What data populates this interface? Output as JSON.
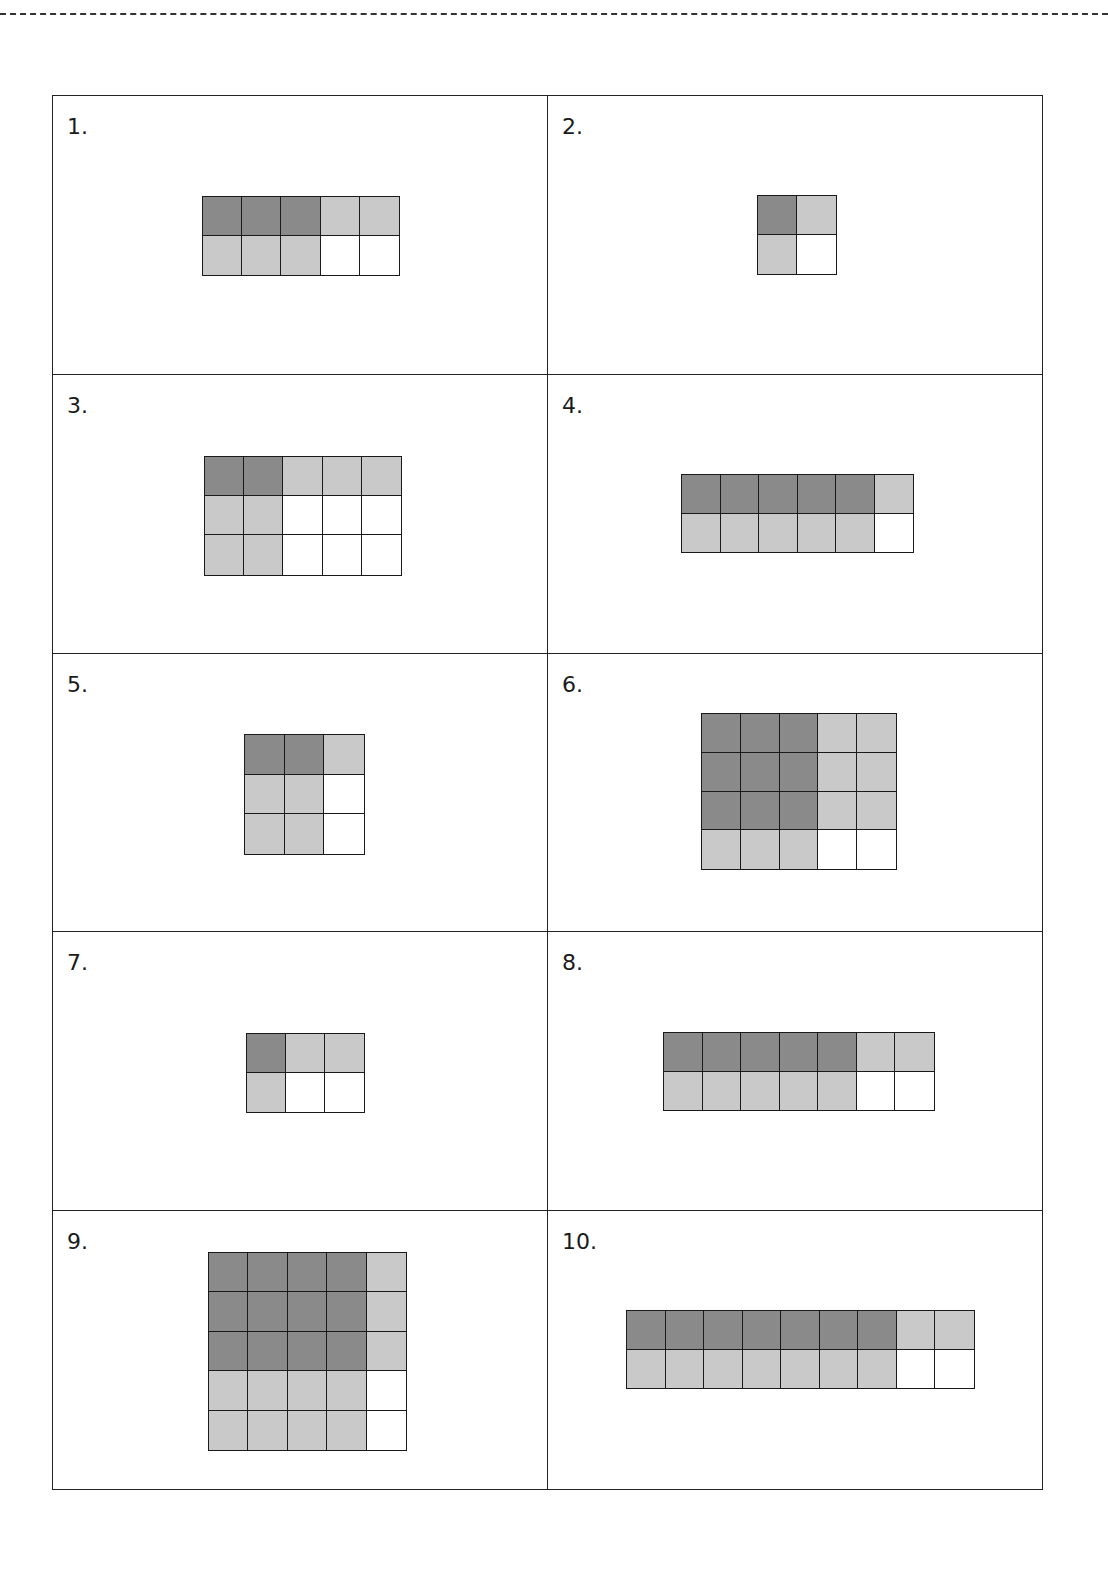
{
  "colors": {
    "dark": "#8a8a8a",
    "light": "#c9c9c9",
    "empty": "#ffffff",
    "line": "#1a1a1a"
  },
  "problems": [
    {
      "label": "1.",
      "rows": 2,
      "cols": 5,
      "pattern": [
        "DDDLL",
        "LLLWW"
      ],
      "dark_count": 3,
      "light_count": 5,
      "empty_count": 2
    },
    {
      "label": "2.",
      "rows": 2,
      "cols": 2,
      "pattern": [
        "DL",
        "LW"
      ],
      "dark_count": 1,
      "light_count": 2,
      "empty_count": 1
    },
    {
      "label": "3.",
      "rows": 3,
      "cols": 5,
      "pattern": [
        "DDLLL",
        "LLWWW",
        "LLWWW"
      ],
      "dark_count": 2,
      "light_count": 7,
      "empty_count": 6
    },
    {
      "label": "4.",
      "rows": 2,
      "cols": 6,
      "pattern": [
        "DDDDDL",
        "LLLLLW"
      ],
      "dark_count": 5,
      "light_count": 6,
      "empty_count": 1
    },
    {
      "label": "5.",
      "rows": 3,
      "cols": 3,
      "pattern": [
        "DDL",
        "LLW",
        "LLW"
      ],
      "dark_count": 2,
      "light_count": 5,
      "empty_count": 2
    },
    {
      "label": "6.",
      "rows": 4,
      "cols": 5,
      "pattern": [
        "DDDLL",
        "DDDLL",
        "DDDLL",
        "LLLWW"
      ],
      "dark_count": 9,
      "light_count": 9,
      "empty_count": 2
    },
    {
      "label": "7.",
      "rows": 2,
      "cols": 3,
      "pattern": [
        "DLL",
        "LWW"
      ],
      "dark_count": 1,
      "light_count": 3,
      "empty_count": 2
    },
    {
      "label": "8.",
      "rows": 2,
      "cols": 7,
      "pattern": [
        "DDDDDLL",
        "LLLLLWW"
      ],
      "dark_count": 5,
      "light_count": 7,
      "empty_count": 2
    },
    {
      "label": "9.",
      "rows": 5,
      "cols": 5,
      "pattern": [
        "DDDDL",
        "DDDDL",
        "DDDDL",
        "LLLLW",
        "LLLLW"
      ],
      "dark_count": 12,
      "light_count": 11,
      "empty_count": 2
    },
    {
      "label": "10.",
      "rows": 2,
      "cols": 9,
      "pattern": [
        "DDDDDDDLL",
        "LLLLLLLWW"
      ],
      "dark_count": 7,
      "light_count": 9,
      "empty_count": 2
    }
  ]
}
